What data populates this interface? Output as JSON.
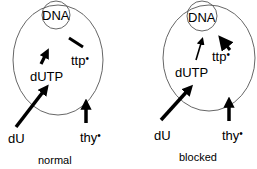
{
  "panels": [
    {
      "caption": "normal",
      "labels": {
        "dna": "DNA",
        "ttp": "ttp",
        "dutp": "dUTP",
        "du": "dU",
        "thy": "thy"
      },
      "star": "•"
    },
    {
      "caption": "blocked",
      "labels": {
        "dna": "DNA",
        "ttp": "ttp",
        "dutp": "dUTP",
        "du": "dU",
        "thy": "thy"
      },
      "star": "•"
    }
  ],
  "colors": {
    "ink": "#000000",
    "outline": "#555555",
    "background": "#ffffff"
  }
}
